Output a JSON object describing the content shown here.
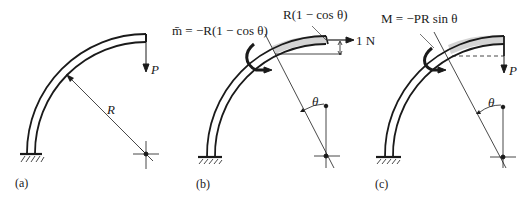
{
  "figure": {
    "panels": [
      {
        "id": "a",
        "caption": "(a)",
        "labels": {
          "load": "P",
          "radius": "R"
        }
      },
      {
        "id": "b",
        "caption": "(b)",
        "labels": {
          "moment_eq": "m̄ = −R(1 − cos θ)",
          "offset": "R(1 − cos θ)",
          "unit_load": "1 N",
          "angle": "θ"
        }
      },
      {
        "id": "c",
        "caption": "(c)",
        "labels": {
          "moment_eq": "M = −PR sin θ",
          "load": "P",
          "angle": "θ"
        }
      }
    ],
    "colors": {
      "line": "#1a1a1a",
      "shaded": "#d4d4d4",
      "background": "#ffffff"
    }
  }
}
